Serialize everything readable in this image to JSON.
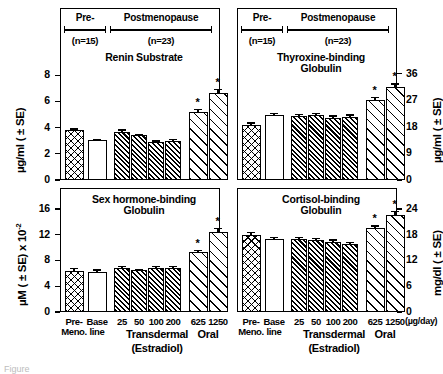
{
  "figure": {
    "groups": {
      "pre_label": "Pre-",
      "pre_n": "(n=15)",
      "post_label": "Postmenopause",
      "post_n": "(n=23)"
    },
    "xaxis": {
      "categories": [
        "Pre-\nMeno.",
        "Base\nline",
        "25",
        "50",
        "100",
        "200",
        "625",
        "1250"
      ],
      "tick_labels": [
        "Pre-",
        "Meno.",
        "Base",
        "line",
        "25",
        "50",
        "100",
        "200",
        "625",
        "1250"
      ],
      "group_transdermal": "Transdermal",
      "group_oral": "Oral",
      "group_sub": "(Estradiol)",
      "unit": "(µg/day)"
    },
    "caption_fragment": "Figure"
  },
  "chart_data": [
    {
      "type": "bar",
      "panel": "top-left",
      "title": "Renin Substrate",
      "ylabel": "µg/ml ( ± SE)",
      "ylim": [
        0,
        9
      ],
      "ticks": [
        0,
        2,
        4,
        6,
        8
      ],
      "categories": [
        "Pre-Meno.",
        "Base line",
        "25",
        "50",
        "100",
        "200",
        "625",
        "1250"
      ],
      "values": [
        3.78,
        3.02,
        3.68,
        3.42,
        2.9,
        2.98,
        5.22,
        6.65
      ],
      "errors": [
        0.16,
        0.12,
        0.18,
        0.12,
        0.12,
        0.14,
        0.22,
        0.32
      ],
      "significant": [
        false,
        false,
        false,
        false,
        false,
        false,
        true,
        true
      ],
      "fills": [
        "cross",
        "open",
        "dense",
        "dense",
        "dense",
        "dense",
        "light",
        "light"
      ]
    },
    {
      "type": "bar",
      "panel": "top-right",
      "title": "Thyroxine-binding\nGlobulin",
      "ylabel": "µg/ml ( ± SE)",
      "ylim": [
        0,
        40
      ],
      "ticks": [
        0,
        9,
        18,
        27,
        36
      ],
      "categories": [
        "Pre-Meno.",
        "Base line",
        "25",
        "50",
        "100",
        "200",
        "625",
        "1250"
      ],
      "values": [
        18.6,
        22.0,
        21.6,
        21.9,
        21.1,
        21.4,
        27.2,
        31.6
      ],
      "errors": [
        0.9,
        0.8,
        0.8,
        0.9,
        0.8,
        0.9,
        1.0,
        1.2
      ],
      "significant": [
        false,
        false,
        false,
        false,
        false,
        false,
        true,
        true
      ],
      "fills": [
        "cross",
        "open",
        "dense",
        "dense",
        "dense",
        "dense",
        "light",
        "light"
      ]
    },
    {
      "type": "bar",
      "panel": "bottom-left",
      "title": "Sex hormone-binding\nGlobulin",
      "ylabel": "µM ( ± SE) x 10⁻²",
      "ylim": [
        0,
        18
      ],
      "ticks": [
        0,
        4,
        8,
        12,
        16
      ],
      "categories": [
        "Pre-Meno.",
        "Base line",
        "25",
        "50",
        "100",
        "200",
        "625",
        "1250"
      ],
      "values": [
        6.35,
        6.25,
        6.85,
        6.45,
        6.85,
        6.85,
        9.25,
        12.35
      ],
      "errors": [
        0.45,
        0.38,
        0.3,
        0.25,
        0.3,
        0.28,
        0.38,
        0.75
      ],
      "significant": [
        false,
        false,
        false,
        false,
        false,
        false,
        true,
        true
      ],
      "fills": [
        "cross",
        "open",
        "dense",
        "dense",
        "dense",
        "dense",
        "light",
        "light"
      ]
    },
    {
      "type": "bar",
      "panel": "bottom-right",
      "title": "Cortisol-binding\nGlobulin",
      "ylabel": "mg/dl ( ± SE)",
      "ylim": [
        0,
        27
      ],
      "ticks": [
        0,
        6,
        12,
        18,
        24
      ],
      "categories": [
        "Pre-Meno.",
        "Base line",
        "25",
        "50",
        "100",
        "200",
        "625",
        "1250"
      ],
      "values": [
        17.9,
        16.9,
        16.9,
        16.7,
        16.4,
        15.9,
        19.5,
        22.6
      ],
      "errors": [
        0.7,
        0.6,
        0.6,
        0.6,
        0.5,
        0.4,
        0.7,
        1.0
      ],
      "significant": [
        false,
        false,
        false,
        false,
        false,
        false,
        true,
        true
      ],
      "fills": [
        "cross",
        "open",
        "dense",
        "dense",
        "dense",
        "dense",
        "light",
        "light"
      ]
    }
  ]
}
